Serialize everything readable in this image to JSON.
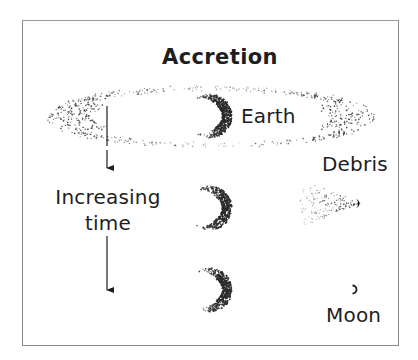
{
  "figure": {
    "title": "Accretion",
    "labels": {
      "earth": "Earth",
      "debris": "Debris",
      "time_line1": "Increasing",
      "time_line2": "time",
      "moon": "Moon"
    },
    "colors": {
      "ink": "#1e1e1e",
      "stipple": "#2a2a2a",
      "frame": "#8c8c8c",
      "background": "#ffffff"
    },
    "stages": [
      {
        "name": "debris-disk-around-earth",
        "earth_center": [
          210,
          116
        ],
        "disk_center": [
          210,
          117
        ],
        "disk_rx": 165,
        "disk_ry": 30
      },
      {
        "name": "debris-clump-forming",
        "earth_center": [
          210,
          208
        ],
        "debris_center": [
          357,
          203
        ]
      },
      {
        "name": "moon-formed",
        "earth_center": [
          210,
          290
        ],
        "moon_center": [
          355,
          290
        ]
      }
    ],
    "time_arrow": {
      "x": 107,
      "segments": [
        [
          106,
          146
        ],
        [
          150,
          168
        ],
        [
          236,
          290
        ]
      ]
    }
  }
}
